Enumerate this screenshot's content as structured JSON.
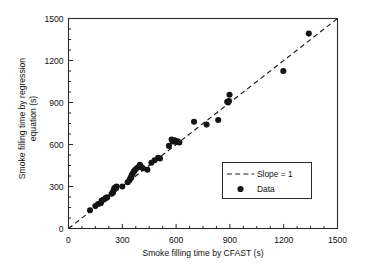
{
  "chart_data": {
    "type": "scatter",
    "title": "",
    "xlabel": "Smoke filling time by CFAST (s)",
    "ylabel_line1": "Smoke filling time by regression",
    "ylabel_line2": "equation (s)",
    "xlim": [
      0,
      1500
    ],
    "ylim": [
      0,
      1500
    ],
    "xticks": [
      0,
      300,
      600,
      900,
      1200,
      1500
    ],
    "yticks": [
      0,
      300,
      600,
      900,
      1200,
      1500
    ],
    "xtick_labels": [
      "0",
      "300",
      "600",
      "900",
      "1200",
      "1500"
    ],
    "ytick_labels": [
      "0",
      "300",
      "600",
      "900",
      "1200",
      "1500"
    ],
    "minor_ticks_per_interval": 3,
    "grid": false,
    "legend_position": "lower-right-inside",
    "series": [
      {
        "name": "Slope = 1",
        "type": "line",
        "style": "dashed",
        "color": "#1a1a1a",
        "x": [
          0,
          1500
        ],
        "y": [
          0,
          1500
        ]
      },
      {
        "name": "Data",
        "type": "scatter",
        "marker": "filled-circle",
        "color": "#141414",
        "points": [
          [
            120,
            130
          ],
          [
            150,
            160
          ],
          [
            165,
            175
          ],
          [
            180,
            180
          ],
          [
            185,
            200
          ],
          [
            195,
            205
          ],
          [
            205,
            215
          ],
          [
            215,
            222
          ],
          [
            240,
            248
          ],
          [
            248,
            255
          ],
          [
            250,
            268
          ],
          [
            255,
            288
          ],
          [
            262,
            295
          ],
          [
            268,
            300
          ],
          [
            300,
            300
          ],
          [
            330,
            330
          ],
          [
            340,
            345
          ],
          [
            345,
            358
          ],
          [
            350,
            365
          ],
          [
            352,
            380
          ],
          [
            358,
            395
          ],
          [
            365,
            408
          ],
          [
            372,
            420
          ],
          [
            382,
            432
          ],
          [
            392,
            440
          ],
          [
            398,
            455
          ],
          [
            405,
            440
          ],
          [
            415,
            430
          ],
          [
            440,
            420
          ],
          [
            462,
            470
          ],
          [
            480,
            488
          ],
          [
            500,
            505
          ],
          [
            510,
            500
          ],
          [
            560,
            590
          ],
          [
            575,
            635
          ],
          [
            582,
            622
          ],
          [
            592,
            630
          ],
          [
            600,
            618
          ],
          [
            608,
            622
          ],
          [
            618,
            615
          ],
          [
            700,
            762
          ],
          [
            770,
            742
          ],
          [
            835,
            775
          ],
          [
            885,
            905
          ],
          [
            890,
            900
          ],
          [
            895,
            910
          ],
          [
            898,
            955
          ],
          [
            1198,
            1125
          ],
          [
            1340,
            1392
          ]
        ]
      }
    ]
  },
  "legend": {
    "slope_label": "Slope = 1",
    "data_label": "Data"
  },
  "axes": {
    "frame_color": "#2b2b2b"
  }
}
